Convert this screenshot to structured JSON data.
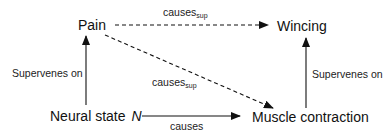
{
  "nodes": {
    "pain": "Pain",
    "wincing": "Wincing",
    "neural_state": "Neural state",
    "neural_state_var": "N",
    "muscle_contraction": "Muscle contraction"
  },
  "edges": {
    "pain_to_wincing": {
      "label": "causes",
      "subscript": "sup",
      "style": "dashed"
    },
    "pain_to_muscle": {
      "label": "causes",
      "subscript": "sup",
      "style": "dashed"
    },
    "neural_to_muscle": {
      "label": "causes",
      "style": "solid"
    },
    "neural_to_pain": {
      "label": "Supervenes on",
      "style": "solid"
    },
    "muscle_to_wincing": {
      "label": "Supervenes on",
      "style": "solid"
    }
  },
  "colors": {
    "ink": "#111111",
    "background": "#ffffff"
  }
}
